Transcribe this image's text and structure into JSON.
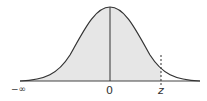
{
  "diagram": {
    "type": "standard-normal-curve",
    "shaded_region": "from -infinity to z",
    "labels": {
      "neg_infinity": "−∞",
      "mean": "0",
      "z": "z"
    },
    "colors": {
      "curve": "#333333",
      "shade": "#e6e6e6",
      "axis": "#444444"
    }
  }
}
